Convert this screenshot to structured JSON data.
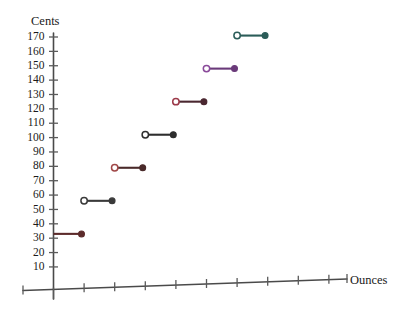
{
  "chart_data": {
    "type": "line",
    "subtype": "step-function",
    "title": "",
    "xlabel": "Ounces",
    "ylabel": "Cents",
    "ylim": [
      0,
      175
    ],
    "xlim": [
      0,
      10
    ],
    "grid": false,
    "legend": null,
    "y_ticks": [
      10,
      20,
      30,
      40,
      50,
      60,
      70,
      80,
      90,
      100,
      110,
      120,
      130,
      140,
      150,
      160,
      170
    ],
    "y_tick_labels": [
      "10",
      "20",
      "30",
      "40",
      "50",
      "60",
      "70",
      "80",
      "90",
      "100",
      "110",
      "120",
      "130",
      "140",
      "150",
      "160",
      "170"
    ],
    "x_ticks": [
      1,
      2,
      3,
      4,
      5,
      6,
      7,
      8,
      9,
      10
    ],
    "x_tick_labels": [
      "",
      "",
      "",
      "",
      "",
      "",
      "",
      "",
      "",
      ""
    ],
    "series": [
      {
        "name": "postage-rate-steps",
        "segments": [
          {
            "x_start": 0,
            "x_end": 1,
            "y": 33,
            "left_endpoint": "closed-axis",
            "right_endpoint": "closed",
            "color": "#5c2b2b"
          },
          {
            "x_start": 1,
            "x_end": 2,
            "y": 56,
            "left_endpoint": "open",
            "right_endpoint": "closed",
            "color": "#3a3a3a"
          },
          {
            "x_start": 2,
            "x_end": 3,
            "y": 79,
            "left_endpoint": "open",
            "right_endpoint": "closed",
            "color": "#4a2a2a",
            "open_color": "#a04848"
          },
          {
            "x_start": 3,
            "x_end": 4,
            "y": 102,
            "left_endpoint": "open",
            "right_endpoint": "closed",
            "color": "#2e2e2e"
          },
          {
            "x_start": 4,
            "x_end": 5,
            "y": 125,
            "left_endpoint": "open",
            "right_endpoint": "closed",
            "color": "#4a2730",
            "open_color": "#9c3a4a"
          },
          {
            "x_start": 5,
            "x_end": 6,
            "y": 148,
            "left_endpoint": "open",
            "right_endpoint": "closed",
            "color": "#6a3a7a",
            "open_color": "#8a4a9a"
          },
          {
            "x_start": 6,
            "x_end": 7,
            "y": 171,
            "left_endpoint": "open",
            "right_endpoint": "closed",
            "color": "#2a5c58",
            "open_color": "#2a5c58"
          }
        ]
      }
    ]
  },
  "labels": {
    "y_axis_title": "Cents",
    "x_axis_title": "Ounces"
  },
  "colors": {
    "axis": "#4a4a4a",
    "text": "#1a1a1a",
    "background": "#ffffff"
  }
}
